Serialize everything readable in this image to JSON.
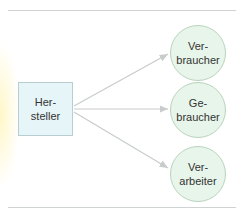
{
  "diagram": {
    "source": {
      "line1": "Her-",
      "line2": "steller"
    },
    "targets": [
      {
        "line1": "Ver-",
        "line2": "braucher"
      },
      {
        "line1": "Ge-",
        "line2": "braucher"
      },
      {
        "line1": "Ver-",
        "line2": "arbeiter"
      }
    ],
    "colors": {
      "box_fill": "#e6f5f8",
      "circle_fill": "#e8f5ea",
      "arrow": "#c8cccc",
      "rule": "#cfd3d3"
    }
  }
}
